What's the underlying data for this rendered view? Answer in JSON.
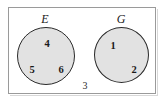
{
  "diagram": {
    "type": "venn-diagram",
    "universe": {
      "name": "universal-set-rectangle",
      "border_color": "#9a9a9a",
      "background_color": "#ffffff"
    },
    "sets": [
      {
        "id": "E",
        "label": "E",
        "position": "left",
        "fill_color": "#e2e2e2",
        "border_color": "#2a2a2a",
        "members": [
          "4",
          "5",
          "6"
        ]
      },
      {
        "id": "G",
        "label": "G",
        "position": "right",
        "fill_color": "#e2e2e2",
        "border_color": "#2a2a2a",
        "members": [
          "1",
          "2"
        ]
      }
    ],
    "outside_elements": [
      "3"
    ],
    "elements": {
      "e_top": "4",
      "e_bottom_left": "5",
      "e_bottom_right": "6",
      "g_top_left": "1",
      "g_bottom_right": "2",
      "outside": "3"
    }
  }
}
